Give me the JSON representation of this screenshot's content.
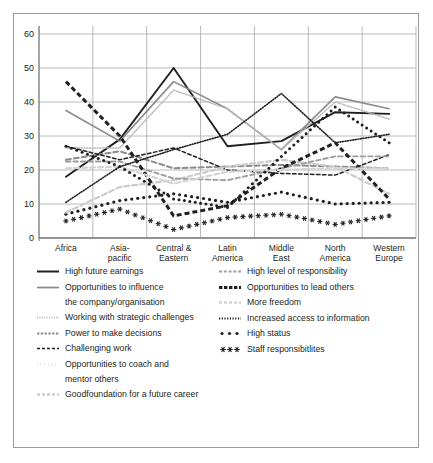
{
  "chart_data": {
    "type": "line",
    "title": "",
    "xlabel": "",
    "ylabel": "",
    "ylim": [
      0,
      60
    ],
    "yticks": [
      0,
      10,
      20,
      30,
      40,
      50,
      60
    ],
    "grid": true,
    "legend_position": "below",
    "categories": [
      "Africa",
      "Asia-pacific",
      "Central & Eastern Europe",
      "Latin America",
      "Middle East",
      "North America",
      "Western Europe"
    ],
    "category_lines": [
      [
        "Africa"
      ],
      [
        "Asia-",
        "pacific"
      ],
      [
        "Central &",
        "Eastern",
        "Europe"
      ],
      [
        "Latin",
        "America"
      ],
      [
        "Middle",
        "East"
      ],
      [
        "North",
        "America"
      ],
      [
        "Western",
        "Europe"
      ]
    ],
    "series": [
      {
        "name": "High future earnings",
        "style": "solid",
        "color": "#231f20",
        "width": 1.9,
        "values": [
          18,
          29,
          50,
          27,
          28.5,
          37,
          36.5
        ]
      },
      {
        "name": "Opportunities to influence the company/organisation",
        "style": "solid",
        "color": "#8c8c8c",
        "width": 1.6,
        "values": [
          37.5,
          28.5,
          46,
          38,
          26,
          41.5,
          38
        ]
      },
      {
        "name": "Working with strategic challenges",
        "style": "fine-dot",
        "color": "#b9b9b9",
        "width": 1.5,
        "values": [
          26.5,
          26.5,
          43.5,
          38,
          26,
          40,
          35
        ]
      },
      {
        "name": "Power to make decisions",
        "style": "dash-grey",
        "color": "#8c8c8c",
        "width": 2.0,
        "values": [
          23,
          25.5,
          20.5,
          21,
          21.5,
          21,
          20.5
        ]
      },
      {
        "name": "Challenging work",
        "style": "dash-black",
        "color": "#231f20",
        "width": 1.5,
        "values": [
          27,
          23,
          26.5,
          20,
          19,
          18.5,
          24.5
        ]
      },
      {
        "name": "Opportunities to coach and mentor others",
        "style": "dot-round-black",
        "color": "#231f20",
        "width": 2.6,
        "values": [
          7,
          11,
          13,
          10.5,
          13.5,
          10,
          10.5
        ]
      },
      {
        "name": "Goodfoundation for a future career",
        "style": "dash-lightgrey",
        "color": "#cccccc",
        "width": 2.2,
        "values": [
          7.5,
          15,
          17,
          21,
          23,
          21,
          13
        ]
      },
      {
        "name": "High level of responsibility",
        "style": "dash-mid",
        "color": "#9e9e9e",
        "width": 1.9,
        "values": [
          22.5,
          22.5,
          17.5,
          17,
          20.5,
          24,
          24
        ]
      },
      {
        "name": "Opportunities to lead others",
        "style": "thick-dash",
        "color": "#231f20",
        "width": 3.0,
        "values": [
          46,
          30,
          6.5,
          9.5,
          20.5,
          28,
          11.5
        ]
      },
      {
        "name": "More freedom",
        "style": "dash-pale",
        "color": "#d4d4d4",
        "width": 2.2,
        "values": [
          20.5,
          21,
          16,
          19.5,
          20,
          20.5,
          20.5
        ]
      },
      {
        "name": "Increased access to information",
        "style": "fine-dot-black",
        "color": "#231f20",
        "width": 1.6,
        "values": [
          10.5,
          21,
          26,
          30.5,
          42.5,
          28,
          30.5
        ]
      },
      {
        "name": "High status",
        "style": "dot-black",
        "color": "#231f20",
        "width": 2.0,
        "values": [
          27,
          21,
          11.5,
          9,
          24,
          38.5,
          28
        ]
      },
      {
        "name": "Staff responsibitlites",
        "style": "star",
        "color": "#231f20",
        "width": 1.4,
        "values": [
          5,
          8.5,
          2.5,
          6,
          7,
          4,
          6.5
        ]
      }
    ]
  },
  "axis": {
    "ticks": [
      "60",
      "50",
      "40",
      "30",
      "20",
      "10",
      "0"
    ]
  },
  "legend": {
    "left": [
      {
        "key": "High future earnings",
        "sample": "solid-black",
        "cont": ""
      },
      {
        "key": "Opportunities to influence",
        "sample": "solid-grey",
        "cont": "the company/organisation"
      },
      {
        "key": "Working with strategic challenges",
        "sample": "fine-dot-grey",
        "cont": ""
      },
      {
        "key": "Power to make decisions",
        "sample": "dash-grey",
        "cont": ""
      },
      {
        "key": "Challenging work",
        "sample": "dash-black",
        "cont": ""
      },
      {
        "key": "Opportunities to coach and",
        "sample": "dot-round-black",
        "cont": "mentor others"
      },
      {
        "key": "Goodfoundation for a future career",
        "sample": "dash-lightgrey",
        "cont": ""
      }
    ],
    "right": [
      {
        "key": "High level of responsibility",
        "sample": "dash-mid",
        "cont": ""
      },
      {
        "key": "Opportunities to lead others",
        "sample": "thick-dash",
        "cont": ""
      },
      {
        "key": "More freedom",
        "sample": "dash-pale",
        "cont": ""
      },
      {
        "key": "Increased access to information",
        "sample": "fine-dot-black",
        "cont": ""
      },
      {
        "key": "High status",
        "sample": "dot-black",
        "cont": ""
      },
      {
        "key": "Staff responsibitlites",
        "sample": "star",
        "cont": ""
      }
    ]
  }
}
